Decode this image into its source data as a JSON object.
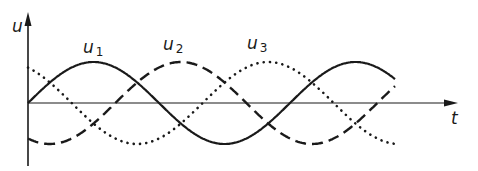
{
  "diagram": {
    "axes": {
      "y_label": "u",
      "x_label": "t"
    },
    "curves": [
      {
        "name": "u1",
        "label_base": "u",
        "label_sub": "1",
        "style": "solid",
        "phase_deg": 0
      },
      {
        "name": "u2",
        "label_base": "u",
        "label_sub": "2",
        "style": "dashed",
        "phase_deg": -120
      },
      {
        "name": "u3",
        "label_base": "u",
        "label_sub": "3",
        "style": "dotted",
        "phase_deg": 120
      }
    ],
    "colors": {
      "ink": "#1a1a1a",
      "background": "#ffffff"
    }
  }
}
